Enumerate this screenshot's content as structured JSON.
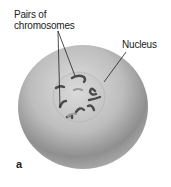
{
  "figure": {
    "panel_letter": "a",
    "labels": {
      "chromosomes_line1": "Pairs of",
      "chromosomes_line2": "chromosomes",
      "nucleus": "Nucleus"
    },
    "colors": {
      "cell_light": "#d8d8d8",
      "cell_dark": "#8a8a8a",
      "nucleus": "#d2d2d2",
      "chromosome": "#4a4a4a",
      "leader_line": "#222222"
    }
  }
}
